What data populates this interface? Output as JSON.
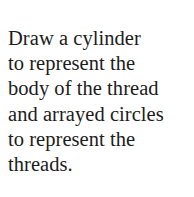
{
  "document": {
    "background_color": "#ffffff",
    "text_color": "#1c1c1c",
    "body_lines": [
      "Draw a cylinder",
      "to represent the",
      "body of the thread",
      "and arrayed circles",
      "to represent the",
      "threads."
    ],
    "full_text": "Draw a cylinder to represent the body of the thread and arrayed circles to represent the threads."
  }
}
